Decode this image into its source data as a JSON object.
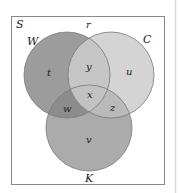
{
  "universe": {
    "label": "S",
    "outside_region": "r"
  },
  "sets": [
    {
      "id": "W",
      "label": "W",
      "color": "#9c9c9c"
    },
    {
      "id": "C",
      "label": "C",
      "color": "#d4d4d4"
    },
    {
      "id": "K",
      "label": "K",
      "color": "#ababab"
    }
  ],
  "regions": {
    "W_only": "t",
    "C_only": "u",
    "K_only": "v",
    "W_and_C_only": "y",
    "W_and_K_only": "w",
    "C_and_K_only": "z",
    "all_three": "x",
    "outside": "r"
  },
  "colors": {
    "border": "#8a8a8a",
    "wc": "#c6c6c6",
    "wk": "#8c8c8c",
    "ck": "#bababa",
    "wck": "#c2c2c2",
    "circle_stroke": "#7a7a7a",
    "separator": "#d8d8d8"
  }
}
